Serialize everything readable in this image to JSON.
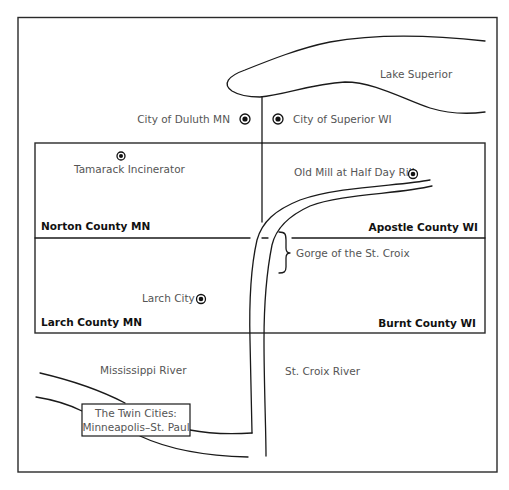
{
  "map": {
    "title": "St. Croix region map",
    "water_features": {
      "lake": "Lake Superior",
      "mississippi": "Mississippi River",
      "st_croix": "St. Croix River",
      "gorge": "Gorge of the St. Croix"
    },
    "counties": {
      "norton": "Norton County MN",
      "apostle": "Apostle County WI",
      "larch": "Larch County MN",
      "burnt": "Burnt County WI"
    },
    "places": {
      "duluth": "City of Duluth MN",
      "superior": "City of Superior WI",
      "tamarack": "Tamarack Incinerator",
      "old_mill": "Old Mill at Half Day Rill",
      "larch_city": "Larch City"
    },
    "twin_cities": {
      "line1": "The Twin Cities:",
      "line2": "Minneapolis–St. Paul"
    },
    "colors": {
      "line": "#1a1a1a",
      "label_text": "#555555",
      "county_text": "#111111",
      "background": "#ffffff"
    }
  }
}
